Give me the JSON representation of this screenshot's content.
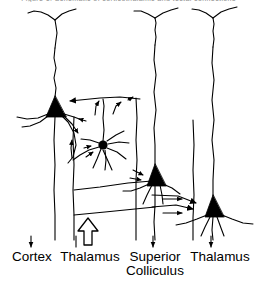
{
  "figure": {
    "cut_caption": "Figure 1. Schematic of corticothalamic and tectal connections",
    "type": "neuroanatomy-circuit-diagram",
    "background_color": "#ffffff",
    "ink_color": "#000000",
    "labels": [
      {
        "id": "cortex",
        "text": "Cortex",
        "x": 32,
        "y": 257
      },
      {
        "id": "thalamus-left",
        "text": "Thalamus",
        "x": 90,
        "y": 257
      },
      {
        "id": "superior",
        "text": "Superior",
        "x": 155,
        "y": 257
      },
      {
        "id": "colliculus",
        "text": "Colliculus",
        "x": 155,
        "y": 271
      },
      {
        "id": "thalamus-right",
        "text": "Thalamus",
        "x": 220,
        "y": 257
      }
    ],
    "regions": [
      {
        "name": "Cortex",
        "column": 1
      },
      {
        "name": "Thalamus",
        "column": 2
      },
      {
        "name": "Superior Colliculus",
        "column": 3
      },
      {
        "name": "Thalamus",
        "column": 4
      }
    ],
    "neurons": [
      {
        "id": "cortical-pyramidal",
        "kind": "pyramidal",
        "soma_x": 55,
        "soma_y": 106,
        "region": "Cortex"
      },
      {
        "id": "thalamic-relay-left",
        "kind": "multipolar",
        "soma_x": 103,
        "soma_y": 145,
        "region": "Thalamus"
      },
      {
        "id": "collicular-neuron",
        "kind": "pyramidal",
        "soma_x": 155,
        "soma_y": 176,
        "region": "Superior Colliculus"
      },
      {
        "id": "thalamic-relay-right",
        "kind": "pyramidal",
        "soma_x": 213,
        "soma_y": 206,
        "region": "Thalamus"
      }
    ],
    "arrow_markers": {
      "descending_small_arrow": "↓",
      "ascending_large_arrow": "⇧",
      "lateral_arrow": "→",
      "synaptic_terminal": "filled-triangle"
    },
    "bottom_arrows": [
      {
        "id": "cortex-output-down",
        "direction": "down",
        "style": "thin",
        "x": 31,
        "y": 240
      },
      {
        "id": "thalamus-input-up",
        "direction": "up",
        "style": "hollow-thick",
        "x": 88,
        "y": 235
      },
      {
        "id": "colliculus-output-down",
        "direction": "down",
        "style": "thin",
        "x": 153,
        "y": 240
      },
      {
        "id": "thalamus-output-down",
        "direction": "down",
        "style": "thin",
        "x": 211,
        "y": 240
      }
    ]
  }
}
